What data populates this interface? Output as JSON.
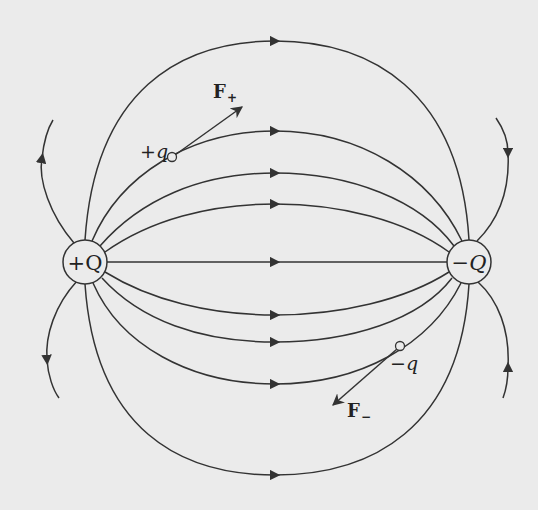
{
  "diagram": {
    "colors": {
      "background": "#ebebeb",
      "line": "#333333"
    },
    "charges": [
      {
        "id": "plus-Q",
        "label": "+Q",
        "cx": 85,
        "cy": 262,
        "r": 22
      },
      {
        "id": "minus-Q",
        "label": "−Q",
        "cx": 469,
        "cy": 262,
        "r": 22
      }
    ],
    "test_charges": [
      {
        "id": "plus-q",
        "label": "+q",
        "cx": 172,
        "cy": 157
      },
      {
        "id": "minus-q",
        "label": "−q",
        "cx": 400,
        "cy": 346
      }
    ],
    "forces": [
      {
        "id": "F-plus",
        "label": "F",
        "subscript": "+",
        "from": [
          172,
          157
        ],
        "to": [
          242,
          107
        ]
      },
      {
        "id": "F-minus",
        "label": "F",
        "subscript": "−",
        "from": [
          400,
          346
        ],
        "to": [
          333,
          405
        ]
      }
    ],
    "field_lines": {
      "upper_apex_y": [
        41,
        131,
        173,
        204
      ],
      "center_y": 262,
      "lower_apex_y": [
        315,
        342,
        384,
        475
      ],
      "arrow_x": 275
    }
  }
}
